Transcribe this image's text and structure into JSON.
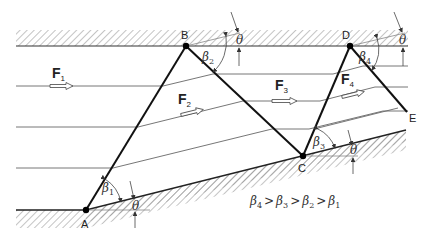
{
  "diagram": {
    "points": {
      "A": {
        "label": "A",
        "x": 86,
        "y": 210
      },
      "B": {
        "label": "B",
        "x": 186,
        "y": 46
      },
      "C": {
        "label": "C",
        "x": 303,
        "y": 156
      },
      "D": {
        "label": "D",
        "x": 350,
        "y": 46
      },
      "E": {
        "label": "E",
        "x": 407,
        "y": 112
      }
    },
    "flow_labels": [
      {
        "id": "F1",
        "main": "F",
        "sub": "1"
      },
      {
        "id": "F2",
        "main": "F",
        "sub": "2"
      },
      {
        "id": "F3",
        "main": "F",
        "sub": "3"
      },
      {
        "id": "F4",
        "main": "F",
        "sub": "4"
      }
    ],
    "angle_labels": [
      {
        "id": "beta1",
        "main": "β",
        "sub": "1"
      },
      {
        "id": "beta2",
        "main": "β",
        "sub": "2"
      },
      {
        "id": "beta3",
        "main": "β",
        "sub": "3"
      },
      {
        "id": "beta4",
        "main": "β",
        "sub": "4"
      },
      {
        "id": "theta",
        "main": "θ"
      }
    ],
    "relation": {
      "b4": "β",
      "s4": "4",
      "gt": ">",
      "b3": "β",
      "s3": "3",
      "b2": "β",
      "s2": "2",
      "b1": "β",
      "s1": "1"
    },
    "colors": {
      "line": "#111111",
      "stream": "#666666",
      "hatch": "#888888"
    }
  }
}
